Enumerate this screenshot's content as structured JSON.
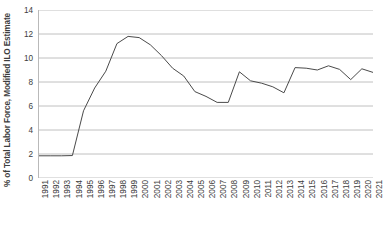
{
  "chart_data": {
    "type": "line",
    "title": "",
    "xlabel": "",
    "ylabel": "% of Total Labor Force, Modified ILO Estimate",
    "ylim": [
      0,
      14
    ],
    "yticks": [
      0,
      2,
      4,
      6,
      8,
      10,
      12,
      14
    ],
    "ytick_labels": [
      "0",
      "2",
      "4",
      "6",
      "8",
      "10",
      "12",
      "14"
    ],
    "grid": true,
    "legend": "none",
    "line_color": "#4a4a4a",
    "grid_color": "#b0b0b0",
    "categories": [
      "1991",
      "1992",
      "1993",
      "1994",
      "1995",
      "1996",
      "1997",
      "1998",
      "1999",
      "2000",
      "2001",
      "2002",
      "2003",
      "2004",
      "2005",
      "2006",
      "2007",
      "2008",
      "2009",
      "2010",
      "2011",
      "2012",
      "2013",
      "2014",
      "2015",
      "2016",
      "2017",
      "2018",
      "2019",
      "2020",
      "2021"
    ],
    "values": [
      1.85,
      1.85,
      1.85,
      1.87,
      5.6,
      7.5,
      8.9,
      11.2,
      11.8,
      11.7,
      11.1,
      10.2,
      9.15,
      8.5,
      7.2,
      6.8,
      6.3,
      6.3,
      8.85,
      8.1,
      7.9,
      7.6,
      7.1,
      9.2,
      9.15,
      9.0,
      9.35,
      9.05,
      8.2,
      9.1,
      8.8
    ],
    "series": [
      {
        "name": "Unemployment",
        "values": [
          1.85,
          1.85,
          1.85,
          1.87,
          5.6,
          7.5,
          8.9,
          11.2,
          11.8,
          11.7,
          11.1,
          10.2,
          9.15,
          8.5,
          7.2,
          6.8,
          6.3,
          6.3,
          8.85,
          8.1,
          7.9,
          7.6,
          7.1,
          9.2,
          9.15,
          9.0,
          9.35,
          9.05,
          8.2,
          9.1,
          8.8
        ]
      }
    ]
  }
}
